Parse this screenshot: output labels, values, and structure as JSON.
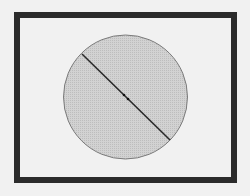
{
  "diagram": {
    "type": "geometry",
    "colors": {
      "background": "#f1f1f1",
      "frame": "#2b2b2b",
      "circle_fill": "#cfcfcf",
      "circle_stroke": "#7a7a7a",
      "diameter": "#2a2a2a",
      "center_point": "#111111"
    },
    "frame": {
      "x": 17,
      "y": 15,
      "width": 217,
      "height": 165,
      "stroke_width": 6
    },
    "circle": {
      "cx": 125.5,
      "cy": 97,
      "r": 62
    },
    "diameter": {
      "x1": 82,
      "y1": 54,
      "x2": 170,
      "y2": 140
    },
    "center_points": [
      {
        "x": 124,
        "y": 95
      },
      {
        "x": 128,
        "y": 99
      }
    ]
  }
}
